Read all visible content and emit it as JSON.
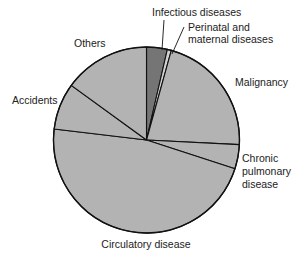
{
  "chart_data": {
    "type": "pie",
    "title": "",
    "start": "12 o'clock",
    "direction": "clockwise",
    "slices": [
      {
        "label": "Infectious diseases",
        "value": 3.6,
        "color": "#757575"
      },
      {
        "label": "Perinatal and maternal diseases",
        "value": 0.7,
        "color": "#d2d2d2"
      },
      {
        "label": "Malignancy",
        "value": 21.5,
        "color": "#b3b3b3"
      },
      {
        "label": "Chronic pulmonary disease",
        "value": 4.2,
        "color": "#b3b3b3"
      },
      {
        "label": "Circulatory disease",
        "value": 46.9,
        "color": "#b3b3b3"
      },
      {
        "label": "Accidents",
        "value": 8.1,
        "color": "#b3b3b3"
      },
      {
        "label": "Others",
        "value": 15.0,
        "color": "#b3b3b3"
      }
    ],
    "labels": {
      "infectious": "Infectious diseases",
      "perinatal_1": "Perinatal and",
      "perinatal_2": "maternal diseases",
      "malignancy": "Malignancy",
      "chronic_1": "Chronic",
      "chronic_2": "pulmonary",
      "chronic_3": "disease",
      "circulatory": "Circulatory disease",
      "accidents": "Accidents",
      "others": "Others"
    },
    "outline_color": "#111111"
  }
}
